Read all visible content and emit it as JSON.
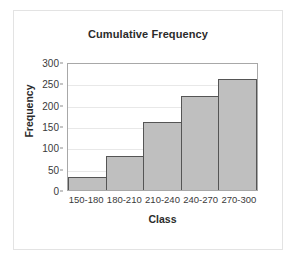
{
  "chart_data": {
    "type": "bar",
    "title": "Cumulative Frequency",
    "xlabel": "Class",
    "ylabel": "Frequency",
    "categories": [
      "150-180",
      "180-210",
      "210-240",
      "240-270",
      "270-300"
    ],
    "values": [
      30,
      80,
      160,
      220,
      260
    ],
    "ylim": [
      0,
      300
    ],
    "yticks": [
      0,
      50,
      100,
      150,
      200,
      250,
      300
    ],
    "ytick_labels": [
      "0",
      "50",
      "100",
      "150",
      "200",
      "250",
      "300"
    ],
    "grid": true,
    "legend": false,
    "bar_fill_color": "#bfbfbf",
    "bar_border_color": "#555555",
    "gridline_color": "#e8e8e8",
    "plot_border_color": "#a8a8a8",
    "frame_border_color": "#e3e3e3",
    "background_color": "#ffffff",
    "text_color": "#2b2b2b"
  }
}
